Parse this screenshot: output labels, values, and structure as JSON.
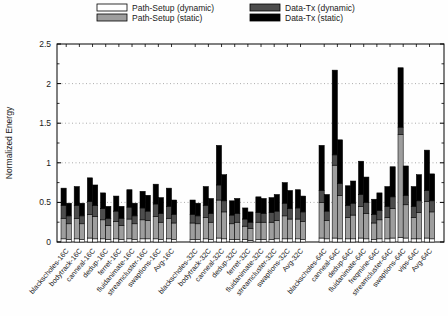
{
  "figure": {
    "kind": "stacked-grouped-bar-chart",
    "background": "#fefefe"
  },
  "chart_data": {
    "type": "bar",
    "stacked": true,
    "bars_per_category": 2,
    "title": "",
    "xlabel": "",
    "ylabel": "Normalized Energy",
    "ylim": [
      0,
      2.5
    ],
    "yticks": [
      "0",
      "0.5",
      "1",
      "1.5",
      "2",
      "2.5"
    ],
    "ytick_values": [
      0,
      0.5,
      1,
      1.5,
      2,
      2.5
    ],
    "y_minor_step": 0.25,
    "grid": "dotted-horizontal",
    "legend_position": "top",
    "segment_order": [
      "Path-Setup (dynamic)",
      "Path-Setup (static)",
      "Data-Tx (dynamic)",
      "Data-Tx (static)"
    ],
    "legend": [
      {
        "label": "Path-Setup (dynamic)",
        "color": "#ffffff"
      },
      {
        "label": "Path-Setup (static)",
        "color": "#9e9e9e"
      },
      {
        "label": "Data-Tx (dynamic)",
        "color": "#4d4d4d"
      },
      {
        "label": "Data-Tx (static)",
        "color": "#000000"
      }
    ],
    "colors": {
      "bar_outline": "#000000",
      "grid": "#8a8a8a",
      "axis": "#000000"
    },
    "groups": [
      {
        "name": "16C",
        "categories": [
          {
            "label": "blackscholes-16C",
            "bars": [
              [
                0.04,
                0.26,
                0.16,
                0.22
              ],
              [
                0.03,
                0.2,
                0.1,
                0.16
              ]
            ]
          },
          {
            "label": "bodytrack-16C",
            "bars": [
              [
                0.04,
                0.26,
                0.16,
                0.24
              ],
              [
                0.03,
                0.2,
                0.1,
                0.16
              ]
            ]
          },
          {
            "label": "canneal-16C",
            "bars": [
              [
                0.05,
                0.3,
                0.16,
                0.3
              ],
              [
                0.04,
                0.28,
                0.14,
                0.26
              ]
            ]
          },
          {
            "label": "dedup-16C",
            "bars": [
              [
                0.04,
                0.24,
                0.14,
                0.2
              ],
              [
                0.03,
                0.18,
                0.09,
                0.15
              ]
            ]
          },
          {
            "label": "ferret-16C",
            "bars": [
              [
                0.04,
                0.22,
                0.13,
                0.19
              ],
              [
                0.03,
                0.18,
                0.09,
                0.15
              ]
            ]
          },
          {
            "label": "fluidanimate-16C",
            "bars": [
              [
                0.04,
                0.25,
                0.15,
                0.22
              ],
              [
                0.03,
                0.2,
                0.1,
                0.16
              ]
            ]
          },
          {
            "label": "streamcluster-16C",
            "bars": [
              [
                0.04,
                0.24,
                0.15,
                0.21
              ],
              [
                0.04,
                0.23,
                0.12,
                0.2
              ]
            ]
          },
          {
            "label": "swaptions-16C",
            "bars": [
              [
                0.04,
                0.28,
                0.16,
                0.25
              ],
              [
                0.03,
                0.22,
                0.11,
                0.2
              ]
            ]
          },
          {
            "label": "Avg-16C",
            "bars": [
              [
                0.04,
                0.26,
                0.15,
                0.23
              ],
              [
                0.03,
                0.21,
                0.11,
                0.18
              ]
            ]
          }
        ]
      },
      {
        "name": "32C",
        "categories": [
          {
            "label": "blackscholes-32C",
            "bars": [
              [
                0.03,
                0.21,
                0.11,
                0.18
              ],
              [
                0.03,
                0.2,
                0.1,
                0.16
              ]
            ]
          },
          {
            "label": "bodytrack-32C",
            "bars": [
              [
                0.04,
                0.27,
                0.15,
                0.24
              ],
              [
                0.03,
                0.22,
                0.11,
                0.19
              ]
            ]
          },
          {
            "label": "canneal-32C",
            "bars": [
              [
                0.05,
                0.48,
                0.19,
                0.5
              ],
              [
                0.04,
                0.34,
                0.14,
                0.33
              ]
            ]
          },
          {
            "label": "dedup-32C",
            "bars": [
              [
                0.03,
                0.2,
                0.11,
                0.18
              ],
              [
                0.03,
                0.22,
                0.11,
                0.19
              ]
            ]
          },
          {
            "label": "ferret-32C",
            "bars": [
              [
                0.03,
                0.17,
                0.09,
                0.14
              ],
              [
                0.02,
                0.15,
                0.08,
                0.13
              ]
            ]
          },
          {
            "label": "fluidanimate-32C",
            "bars": [
              [
                0.03,
                0.22,
                0.12,
                0.2
              ],
              [
                0.03,
                0.22,
                0.11,
                0.19
              ]
            ]
          },
          {
            "label": "streamcluster-32C",
            "bars": [
              [
                0.03,
                0.22,
                0.12,
                0.19
              ],
              [
                0.04,
                0.23,
                0.12,
                0.21
              ]
            ]
          },
          {
            "label": "swaptions-32C",
            "bars": [
              [
                0.04,
                0.29,
                0.16,
                0.26
              ],
              [
                0.04,
                0.25,
                0.13,
                0.23
              ]
            ]
          },
          {
            "label": "Avg-32C",
            "bars": [
              [
                0.04,
                0.25,
                0.14,
                0.23
              ],
              [
                0.03,
                0.23,
                0.12,
                0.2
              ]
            ]
          }
        ]
      },
      {
        "name": "64C",
        "categories": [
          {
            "label": "blackscholes-64C",
            "bars": [
              [
                0.05,
                0.45,
                0.15,
                0.57
              ],
              [
                0.04,
                0.23,
                0.12,
                0.21
              ]
            ]
          },
          {
            "label": "canneal-64C",
            "bars": [
              [
                0.05,
                0.92,
                0.13,
                1.07
              ],
              [
                0.04,
                0.55,
                0.15,
                0.55
              ]
            ]
          },
          {
            "label": "dedup-64C",
            "bars": [
              [
                0.04,
                0.27,
                0.15,
                0.25
              ],
              [
                0.04,
                0.3,
                0.15,
                0.28
              ]
            ]
          },
          {
            "label": "fluidanimate-64C",
            "bars": [
              [
                0.05,
                0.4,
                0.15,
                0.42
              ],
              [
                0.04,
                0.32,
                0.14,
                0.32
              ]
            ]
          },
          {
            "label": "freqmine-64C",
            "bars": [
              [
                0.03,
                0.21,
                0.11,
                0.19
              ],
              [
                0.04,
                0.24,
                0.12,
                0.22
              ]
            ]
          },
          {
            "label": "streamcluster-64C",
            "bars": [
              [
                0.04,
                0.27,
                0.14,
                0.25
              ],
              [
                0.05,
                0.37,
                0.15,
                0.38
              ]
            ]
          },
          {
            "label": "swaptions-64C",
            "bars": [
              [
                0.06,
                1.3,
                0.09,
                0.75
              ],
              [
                0.05,
                0.42,
                0.12,
                0.37
              ]
            ]
          },
          {
            "label": "vips-64C",
            "bars": [
              [
                0.04,
                0.27,
                0.14,
                0.25
              ],
              [
                0.04,
                0.33,
                0.15,
                0.33
              ]
            ]
          },
          {
            "label": "Avg-64C",
            "bars": [
              [
                0.05,
                0.46,
                0.14,
                0.51
              ],
              [
                0.04,
                0.34,
                0.14,
                0.34
              ]
            ]
          }
        ]
      }
    ]
  }
}
